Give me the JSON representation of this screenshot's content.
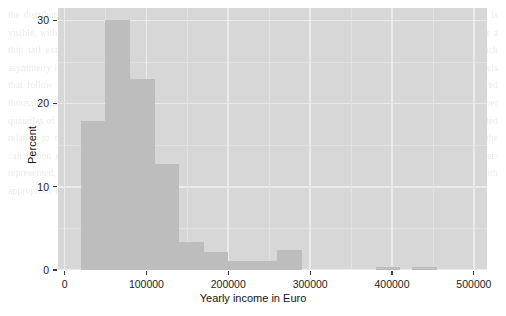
{
  "chart_data": {
    "type": "bar",
    "title": "",
    "subtitle": "",
    "xlabel": "Yearly income in Euro",
    "ylabel": "Percent",
    "grid": true,
    "legend": null,
    "legend_position": "none",
    "xlim": [
      -8000,
      516000
    ],
    "ylim": [
      0,
      31.5
    ],
    "xticks": [
      0,
      100000,
      200000,
      300000,
      400000,
      500000
    ],
    "xticklabels": [
      "0",
      "100000",
      "200000",
      "300000",
      "400000",
      "500000"
    ],
    "yticks": [
      0,
      10,
      20,
      30
    ],
    "yticklabels": [
      "0",
      "10",
      "20",
      "30"
    ],
    "bin_width": 30000,
    "bins": [
      {
        "x0": 20000,
        "x1": 50000,
        "value": 17.9
      },
      {
        "x0": 50000,
        "x1": 80000,
        "value": 30.0
      },
      {
        "x0": 80000,
        "x1": 110000,
        "value": 23.0
      },
      {
        "x0": 110000,
        "x1": 140000,
        "value": 12.8
      },
      {
        "x0": 140000,
        "x1": 170000,
        "value": 3.4
      },
      {
        "x0": 170000,
        "x1": 200000,
        "value": 2.2
      },
      {
        "x0": 200000,
        "x1": 230000,
        "value": 1.1
      },
      {
        "x0": 230000,
        "x1": 260000,
        "value": 1.1
      },
      {
        "x0": 260000,
        "x1": 290000,
        "value": 2.4
      },
      {
        "x0": 380000,
        "x1": 410000,
        "value": 0.4
      },
      {
        "x0": 425000,
        "x1": 455000,
        "value": 0.4
      }
    ],
    "categories": [
      "20000-50000",
      "50000-80000",
      "80000-110000",
      "110000-140000",
      "140000-170000",
      "170000-200000",
      "200000-230000",
      "230000-260000",
      "260000-290000",
      "380000-410000",
      "425000-455000"
    ],
    "values": [
      17.9,
      30.0,
      23.0,
      12.8,
      3.4,
      2.2,
      1.1,
      1.1,
      2.4,
      0.4,
      0.4
    ],
    "colors": {
      "bar": "#a8a8a8",
      "panel": "#d8d8d8",
      "gridline_major": "#fbfbfb",
      "gridline_minor": "#ececec",
      "text": "#1d1d1d",
      "background": "#ffffff"
    }
  },
  "background_text": {
    "lines": [
      "the distribution of reported annual gross income across the surveyed sample of",
      "respondents. A pronounced right skew is visible, with the bulk of observations",
      "concentrated between twenty and one hundred forty thousand Euro per year, while",
      "a thin tail extends well beyond three hundred thousand. The modal class contains",
      "nearly one third of all cases. Such asymmetry is characteristic of income data and",
      "motivates the use of a logarithmic transformation in the regression models that",
      "follow in the next section of this chapter. Note further that a small number of",
      "extreme values near four hundred thousand Euro were retained rather than winsorised,",
      "since excluding them would understate dispersion in the upper quantiles of the",
      "conditional distribution. The histogram uses bins of thirty thousand Euro width.",
      "Percentages are computed relative to the total number of valid responses, and",
      "cases with missing income information were excluded from the calculation entirely.",
      "A comparison with official register statistics suggests that top incomes remain",
      "somewhat under-represented, a limitation common to voluntary survey instruments.",
      "We therefore interpret the upper tail estimates with appropriate caution below."
    ]
  }
}
